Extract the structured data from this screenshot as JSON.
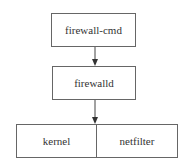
{
  "diagram": {
    "nodes": [
      {
        "id": "firewall-cmd",
        "label": "firewall-cmd"
      },
      {
        "id": "firewalld",
        "label": "firewalld"
      },
      {
        "id": "kernel",
        "label": "kernel"
      },
      {
        "id": "netfilter",
        "label": "netfilter"
      }
    ],
    "edges": [
      {
        "from": "firewall-cmd",
        "to": "firewalld"
      },
      {
        "from": "firewalld",
        "to": "kernel-netfilter"
      }
    ],
    "colors": {
      "stroke": "#666666",
      "text": "#333333",
      "background": "#ffffff"
    }
  }
}
